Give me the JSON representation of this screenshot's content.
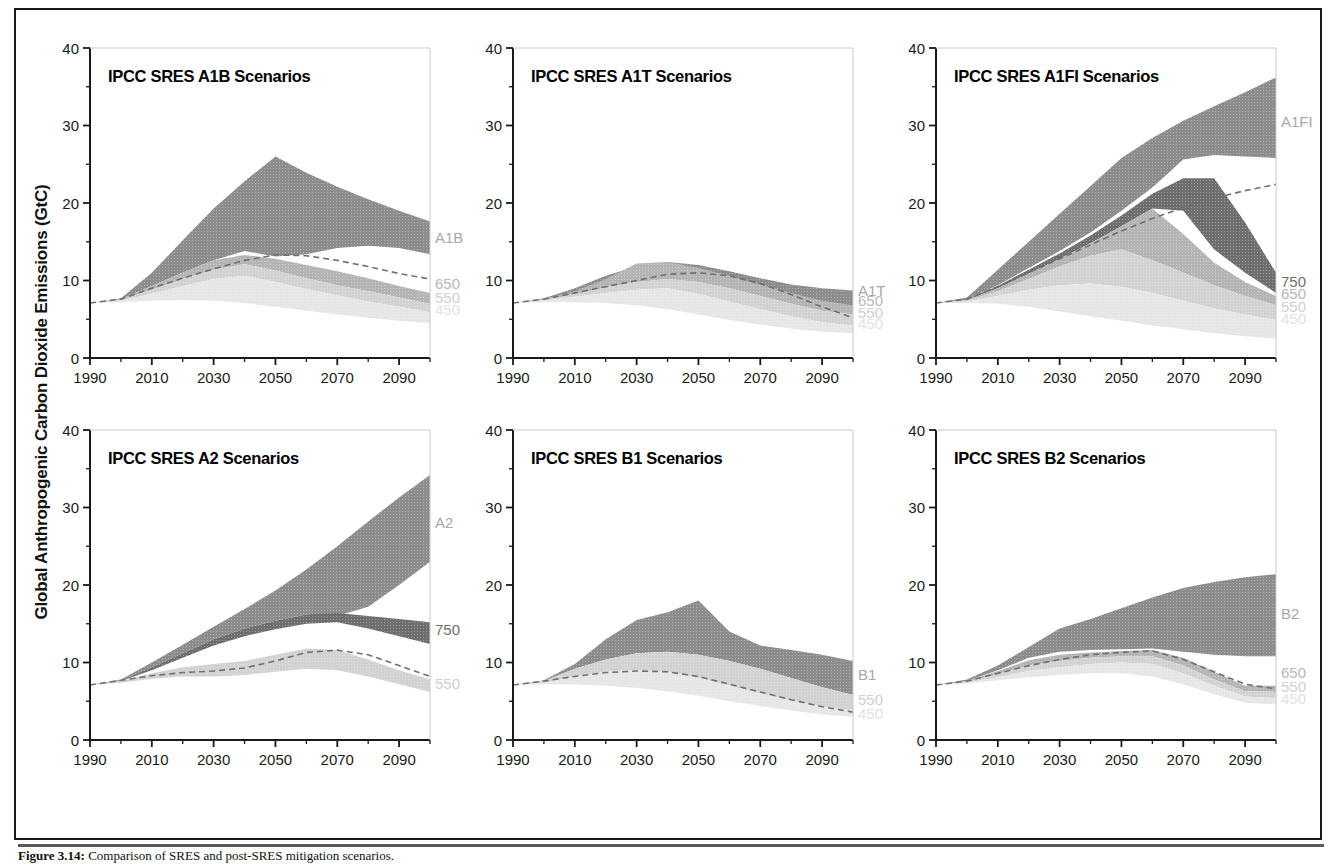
{
  "figure": {
    "axis_title": "Global Anthropogenic Carbon Dioxide Emissions (GtC)",
    "caption_prefix": "Figure 3.14:",
    "caption_text": " Comparison of SRES and post-SRES mitigation scenarios.",
    "frame_color": "#1a1a1a"
  },
  "colors": {
    "band_scenario": "#8c8c8c",
    "band_750": "#6e6e6e",
    "band_650": "#b4b4b4",
    "band_550": "#d2d2d2",
    "band_450": "#e6e6e6",
    "axis": "#1a1a1a",
    "label_scenario": "#a8a8a8",
    "label_750": "#6e6e6e",
    "label_650": "#b8b8b8",
    "label_550": "#d0d0d0",
    "label_450": "#e2e2e2",
    "reference_line": "#707070"
  },
  "axes": {
    "x_ticks": [
      1990,
      2010,
      2030,
      2050,
      2070,
      2090
    ],
    "x_minor_step": 10,
    "x_min": 1990,
    "x_max": 2100,
    "y_ticks": [
      0,
      10,
      20,
      30,
      40
    ],
    "y_minor_step": 5,
    "y_min": 0,
    "y_max": 40,
    "grid": false
  },
  "chart_data": {
    "type": "area",
    "title": "Comparison of SRES and post-SRES mitigation scenarios",
    "xlabel": "",
    "ylabel": "Global Anthropogenic Carbon Dioxide Emissions (GtC)",
    "xlim": [
      1990,
      2100
    ],
    "ylim": [
      0,
      40
    ],
    "legend_position": "right-edge-inline",
    "x": [
      1990,
      2000,
      2010,
      2020,
      2030,
      2040,
      2050,
      2060,
      2070,
      2080,
      2090,
      2100
    ],
    "reference_curve_name": "dashed reference emissions path",
    "panels": [
      {
        "id": "a1b",
        "title": "IPCC SRES A1B Scenarios",
        "row": 0,
        "col": 0,
        "reference": [
          7.1,
          7.6,
          9.0,
          10.3,
          11.5,
          12.6,
          13.3,
          13.2,
          12.6,
          11.8,
          10.9,
          10.2
        ],
        "bands": [
          {
            "name": "A1B",
            "label": "A1B",
            "label_y": 15.5,
            "shade": "band_scenario",
            "upper": [
              7.1,
              7.7,
              11.0,
              15.2,
              19.3,
              22.8,
              26.0,
              23.9,
              22.1,
              20.5,
              19.0,
              17.6
            ],
            "lower": [
              7.1,
              7.6,
              9.3,
              11.0,
              12.6,
              13.8,
              13.1,
              13.4,
              14.2,
              14.5,
              14.2,
              13.4
            ]
          },
          {
            "name": "650",
            "label": "650",
            "label_y": 9.6,
            "shade": "band_650",
            "upper": [
              7.1,
              7.6,
              9.3,
              11.0,
              12.6,
              13.3,
              12.8,
              12.0,
              11.2,
              10.3,
              9.3,
              8.4
            ],
            "lower": [
              7.1,
              7.5,
              8.8,
              10.2,
              11.4,
              12.1,
              11.3,
              10.3,
              9.4,
              8.6,
              7.8,
              7.0
            ]
          },
          {
            "name": "550",
            "label": "550",
            "label_y": 7.8,
            "shade": "band_550",
            "upper": [
              7.1,
              7.5,
              8.8,
              10.2,
              11.4,
              12.1,
              11.3,
              10.3,
              9.4,
              8.6,
              7.8,
              7.0
            ],
            "lower": [
              7.1,
              7.4,
              8.3,
              9.3,
              10.2,
              10.6,
              9.8,
              8.9,
              8.1,
              7.3,
              6.6,
              5.9
            ]
          },
          {
            "name": "450",
            "label": "450",
            "label_y": 6.2,
            "shade": "band_450",
            "upper": [
              7.1,
              7.4,
              8.3,
              9.3,
              10.2,
              10.6,
              9.8,
              8.9,
              8.1,
              7.3,
              6.6,
              5.9
            ],
            "lower": [
              7.1,
              7.2,
              7.4,
              7.5,
              7.4,
              7.1,
              6.6,
              6.1,
              5.6,
              5.2,
              4.8,
              4.5
            ]
          }
        ]
      },
      {
        "id": "a1t",
        "title": "IPCC SRES A1T Scenarios",
        "row": 0,
        "col": 1,
        "reference": [
          7.1,
          7.6,
          8.4,
          9.2,
          10.0,
          10.8,
          11.0,
          10.6,
          9.6,
          8.2,
          6.6,
          5.2
        ],
        "bands": [
          {
            "name": "A1T",
            "label": "A1T",
            "label_y": 8.6,
            "shade": "band_scenario",
            "upper": [
              7.1,
              7.7,
              9.0,
              10.6,
              11.8,
              12.4,
              12.0,
              11.2,
              10.3,
              9.5,
              9.0,
              8.7
            ],
            "lower": [
              7.1,
              7.6,
              8.5,
              9.4,
              10.1,
              10.7,
              10.4,
              9.7,
              8.8,
              7.8,
              7.0,
              6.6
            ]
          },
          {
            "name": "650",
            "label": "650",
            "label_y": 7.3,
            "shade": "band_650",
            "upper": [
              7.1,
              7.6,
              8.6,
              10.2,
              12.2,
              12.4,
              11.6,
              10.6,
              9.5,
              8.4,
              7.4,
              6.8
            ],
            "lower": [
              7.1,
              7.5,
              8.2,
              9.1,
              9.8,
              10.2,
              9.8,
              9.0,
              8.0,
              7.0,
              6.1,
              5.6
            ]
          },
          {
            "name": "550",
            "label": "550",
            "label_y": 5.8,
            "shade": "band_550",
            "upper": [
              7.1,
              7.5,
              8.2,
              9.1,
              9.8,
              10.2,
              9.8,
              9.0,
              8.0,
              7.0,
              6.1,
              5.6
            ],
            "lower": [
              7.1,
              7.4,
              7.9,
              8.4,
              8.8,
              9.0,
              8.3,
              7.3,
              6.3,
              5.4,
              4.6,
              4.2
            ]
          },
          {
            "name": "450",
            "label": "450",
            "label_y": 4.4,
            "shade": "band_450",
            "upper": [
              7.1,
              7.4,
              7.9,
              8.4,
              8.8,
              9.0,
              8.3,
              7.3,
              6.3,
              5.4,
              4.6,
              4.2
            ],
            "lower": [
              7.1,
              7.2,
              7.2,
              7.1,
              6.8,
              6.3,
              5.6,
              4.9,
              4.3,
              3.8,
              3.4,
              3.2
            ]
          }
        ]
      },
      {
        "id": "a1fi",
        "title": "IPCC SRES A1FI Scenarios",
        "row": 0,
        "col": 2,
        "reference": [
          7.1,
          7.6,
          9.2,
          11.0,
          12.8,
          14.6,
          16.4,
          18.0,
          19.4,
          20.6,
          21.6,
          22.4
        ],
        "bands": [
          {
            "name": "A1FI",
            "label": "A1FI",
            "label_y": 30.5,
            "shade": "band_scenario",
            "upper": [
              7.1,
              7.8,
              11.4,
              15.0,
              18.6,
              22.2,
              25.8,
              28.4,
              30.6,
              32.5,
              34.3,
              36.2
            ],
            "lower": [
              7.1,
              7.6,
              9.4,
              11.6,
              13.8,
              16.2,
              19.0,
              22.0,
              25.6,
              26.2,
              26.0,
              25.8
            ]
          },
          {
            "name": "750",
            "label": "750",
            "label_y": 9.8,
            "shade": "band_750",
            "upper": [
              7.1,
              7.6,
              9.3,
              11.4,
              13.5,
              15.8,
              18.4,
              21.2,
              23.2,
              23.2,
              17.5,
              11.0
            ],
            "lower": [
              7.1,
              7.5,
              9.0,
              10.9,
              12.8,
              14.8,
              17.0,
              19.3,
              19.0,
              14.0,
              11.0,
              8.4
            ]
          },
          {
            "name": "650",
            "label": "650",
            "label_y": 8.2,
            "shade": "band_650",
            "upper": [
              7.1,
              7.5,
              9.0,
              10.9,
              12.8,
              14.8,
              17.0,
              19.3,
              16.0,
              12.3,
              9.8,
              8.0
            ],
            "lower": [
              7.1,
              7.4,
              8.6,
              10.2,
              11.8,
              13.2,
              14.0,
              12.6,
              11.0,
              9.4,
              8.0,
              6.8
            ]
          },
          {
            "name": "550",
            "label": "550",
            "label_y": 6.6,
            "shade": "band_550",
            "upper": [
              7.1,
              7.4,
              8.6,
              10.2,
              11.8,
              13.2,
              14.0,
              12.6,
              11.0,
              9.4,
              8.0,
              6.8
            ],
            "lower": [
              7.1,
              7.3,
              8.0,
              8.8,
              9.4,
              9.6,
              9.2,
              8.4,
              7.4,
              6.4,
              5.6,
              4.9
            ]
          },
          {
            "name": "450",
            "label": "450",
            "label_y": 5.0,
            "shade": "band_450",
            "upper": [
              7.1,
              7.3,
              8.0,
              8.8,
              9.4,
              9.6,
              9.2,
              8.4,
              7.4,
              6.4,
              5.6,
              4.9
            ],
            "lower": [
              7.1,
              7.1,
              7.0,
              6.6,
              6.0,
              5.4,
              4.8,
              4.2,
              3.7,
              3.2,
              2.8,
              2.5
            ]
          }
        ]
      },
      {
        "id": "a2",
        "title": "IPCC SRES A2 Scenarios",
        "row": 1,
        "col": 0,
        "reference": [
          7.1,
          7.7,
          8.3,
          8.7,
          8.9,
          9.3,
          10.2,
          11.3,
          11.6,
          11.0,
          9.6,
          8.2
        ],
        "bands": [
          {
            "name": "A2",
            "label": "A2",
            "label_y": 28.0,
            "shade": "band_scenario",
            "upper": [
              7.1,
              7.8,
              10.0,
              12.3,
              14.6,
              16.9,
              19.3,
              22.0,
              25.0,
              28.2,
              31.3,
              34.2
            ],
            "lower": [
              7.1,
              7.7,
              9.4,
              11.2,
              13.0,
              14.4,
              15.4,
              16.2,
              16.0,
              17.2,
              20.0,
              23.0
            ]
          },
          {
            "name": "750",
            "label": "750",
            "label_y": 14.2,
            "shade": "band_750",
            "upper": [
              7.1,
              7.7,
              9.4,
              11.2,
              13.0,
              14.4,
              15.4,
              16.2,
              16.4,
              16.0,
              15.6,
              15.2
            ],
            "lower": [
              7.1,
              7.6,
              9.0,
              10.6,
              12.2,
              13.4,
              14.3,
              15.0,
              15.2,
              14.4,
              13.4,
              12.4
            ]
          },
          {
            "name": "550",
            "label": "550",
            "label_y": 7.2,
            "shade": "band_550",
            "upper": [
              7.1,
              7.6,
              8.6,
              9.4,
              9.8,
              10.2,
              11.0,
              11.8,
              11.6,
              10.4,
              9.0,
              7.8
            ],
            "lower": [
              7.1,
              7.4,
              7.9,
              8.2,
              8.2,
              8.4,
              8.8,
              9.2,
              9.0,
              8.2,
              7.2,
              6.2
            ]
          }
        ]
      },
      {
        "id": "b1",
        "title": "IPCC SRES B1 Scenarios",
        "row": 1,
        "col": 1,
        "reference": [
          7.1,
          7.6,
          8.2,
          8.7,
          8.9,
          8.8,
          8.2,
          7.2,
          6.2,
          5.2,
          4.3,
          3.6
        ],
        "bands": [
          {
            "name": "B1",
            "label": "B1",
            "label_y": 8.4,
            "shade": "band_scenario",
            "upper": [
              7.1,
              7.7,
              9.8,
              13.0,
              15.5,
              16.5,
              18.0,
              14.0,
              12.2,
              11.6,
              11.0,
              10.2
            ],
            "lower": [
              7.1,
              7.6,
              9.2,
              10.4,
              11.2,
              11.4,
              11.0,
              10.2,
              9.2,
              8.0,
              6.8,
              5.8
            ]
          },
          {
            "name": "550",
            "label": "550",
            "label_y": 5.2,
            "shade": "band_550",
            "upper": [
              7.1,
              7.6,
              9.2,
              10.4,
              11.2,
              11.4,
              11.0,
              10.2,
              9.2,
              8.0,
              6.8,
              5.8
            ],
            "lower": [
              7.1,
              7.4,
              8.2,
              8.8,
              9.0,
              8.8,
              8.0,
              7.0,
              6.0,
              5.1,
              4.3,
              3.8
            ]
          },
          {
            "name": "450",
            "label": "450",
            "label_y": 3.3,
            "shade": "band_450",
            "upper": [
              7.1,
              7.4,
              8.2,
              8.8,
              9.0,
              8.8,
              8.0,
              7.0,
              6.0,
              5.1,
              4.3,
              3.8
            ],
            "lower": [
              7.1,
              7.2,
              7.2,
              7.0,
              6.7,
              6.3,
              5.7,
              5.0,
              4.4,
              3.8,
              3.3,
              3.0
            ]
          }
        ]
      },
      {
        "id": "b2",
        "title": "IPCC SRES B2 Scenarios",
        "row": 1,
        "col": 2,
        "reference": [
          7.1,
          7.6,
          8.6,
          9.6,
          10.4,
          11.0,
          11.3,
          11.5,
          10.4,
          8.8,
          7.2,
          6.6
        ],
        "bands": [
          {
            "name": "B2",
            "label": "B2",
            "label_y": 16.2,
            "shade": "band_scenario",
            "upper": [
              7.1,
              7.8,
              9.6,
              12.0,
              14.4,
              15.6,
              17.0,
              18.4,
              19.6,
              20.4,
              21.0,
              21.4
            ],
            "lower": [
              7.1,
              7.6,
              9.0,
              10.6,
              11.4,
              11.6,
              11.7,
              11.8,
              11.4,
              11.0,
              10.8,
              10.8
            ]
          },
          {
            "name": "650",
            "label": "650",
            "label_y": 8.6,
            "shade": "band_650",
            "upper": [
              7.1,
              7.6,
              8.9,
              10.3,
              11.0,
              11.3,
              11.5,
              11.6,
              10.6,
              8.8,
              7.0,
              7.0
            ],
            "lower": [
              7.1,
              7.5,
              8.5,
              9.6,
              10.2,
              10.6,
              10.8,
              10.8,
              9.6,
              7.8,
              6.3,
              6.2
            ]
          },
          {
            "name": "550",
            "label": "550",
            "label_y": 6.9,
            "shade": "band_550",
            "upper": [
              7.1,
              7.5,
              8.5,
              9.6,
              10.2,
              10.6,
              10.8,
              10.8,
              9.6,
              7.8,
              6.3,
              6.2
            ],
            "lower": [
              7.1,
              7.4,
              8.1,
              8.9,
              9.4,
              9.8,
              10.0,
              9.8,
              8.6,
              7.0,
              5.6,
              5.4
            ]
          },
          {
            "name": "450",
            "label": "450",
            "label_y": 5.3,
            "shade": "band_450",
            "upper": [
              7.1,
              7.4,
              8.1,
              8.9,
              9.4,
              9.8,
              10.0,
              9.8,
              8.6,
              7.0,
              5.6,
              5.4
            ],
            "lower": [
              7.1,
              7.3,
              7.7,
              8.1,
              8.4,
              8.6,
              8.6,
              8.2,
              7.2,
              5.9,
              4.8,
              4.6
            ]
          }
        ]
      }
    ]
  }
}
